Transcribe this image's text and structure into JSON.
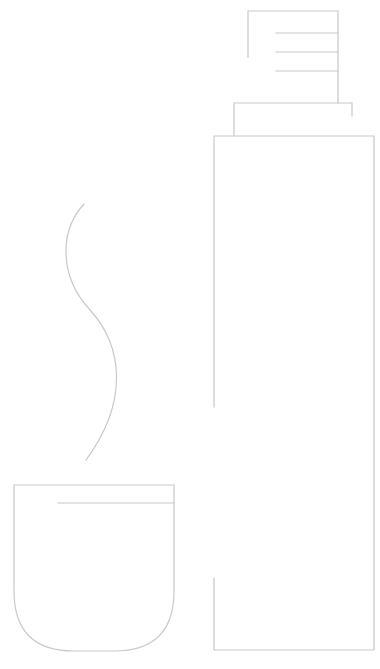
{
  "illustration": {
    "title": "Thermos bottle and cup line drawing",
    "stroke_color": "#c9c9c9",
    "background": "#ffffff",
    "parts": [
      "bottle-cap",
      "bottle-collar",
      "bottle-body",
      "steam-curve",
      "cup"
    ]
  }
}
